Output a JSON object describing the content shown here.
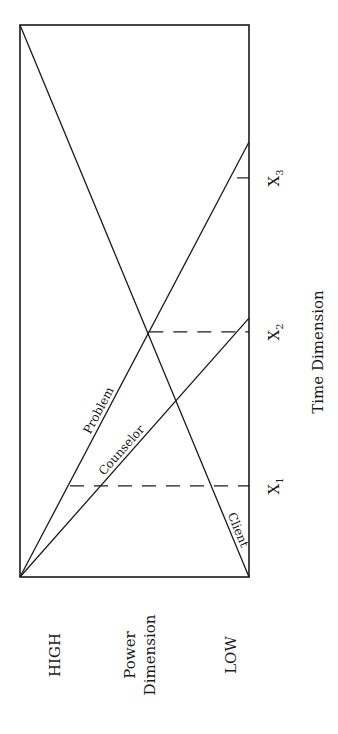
{
  "chart_data": {
    "type": "line",
    "title": "",
    "orientation": "rotated-90-counterclockwise",
    "xlabel": "Time Dimension",
    "ylabel": "Power Dimension",
    "y_high_label": "HIGH",
    "y_low_label": "LOW",
    "ylabel_lines": [
      "Power",
      "Dimension"
    ],
    "xlim": [
      0,
      1
    ],
    "ylim": [
      0,
      1
    ],
    "grid": false,
    "x_markers": [
      {
        "label": "X",
        "sub": "1",
        "x": 0.165,
        "style": "dashed-to-intersection"
      },
      {
        "label": "X",
        "sub": "2",
        "x": 0.444,
        "style": "dashed-to-intersection"
      },
      {
        "label": "X",
        "sub": "3",
        "x": 0.723,
        "style": "tick"
      }
    ],
    "series": [
      {
        "name": "Problem",
        "points": [
          [
            0,
            1
          ],
          [
            0.788,
            0
          ]
        ]
      },
      {
        "name": "Counselor",
        "points": [
          [
            0,
            1
          ],
          [
            0.469,
            0
          ]
        ]
      },
      {
        "name": "Client",
        "points": [
          [
            0,
            0
          ],
          [
            1,
            1
          ]
        ]
      }
    ]
  }
}
